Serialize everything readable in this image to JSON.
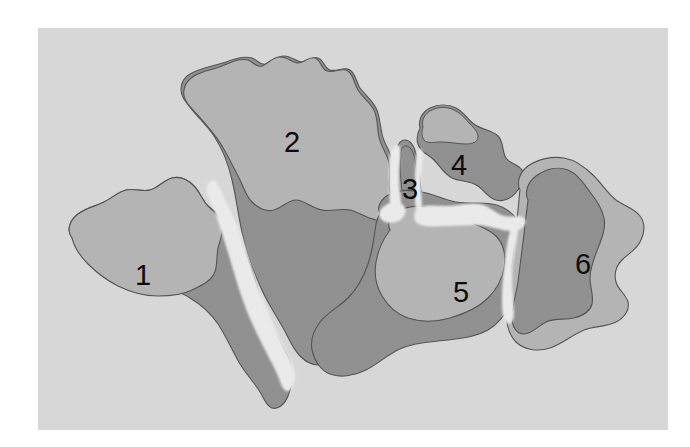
{
  "figure": {
    "kind": "scanned-map-figure",
    "caption_visible": "",
    "plate": {
      "x": 38,
      "y": 28,
      "width": 630,
      "height": 402,
      "background_color": "#d5d5d5",
      "page_margin_color": "#ffffff",
      "paper_texture": true
    },
    "palette": {
      "page": "#ffffff",
      "sea": "#d5d5d5",
      "landmass_fill": "#b0b0b0",
      "shelf_fill": "#8a8a8a",
      "rift_gap": "#e9e9e9",
      "outline": "#4a4a4a",
      "label": "#0b0b0b"
    },
    "labels": [
      {
        "id": "label-1",
        "text": "1",
        "x": 143,
        "y": 277
      },
      {
        "id": "label-2",
        "text": "2",
        "x": 292,
        "y": 144
      },
      {
        "id": "label-3",
        "text": "3",
        "x": 410,
        "y": 191
      },
      {
        "id": "label-4",
        "text": "4",
        "x": 459,
        "y": 167
      },
      {
        "id": "label-5",
        "text": "5",
        "x": 461,
        "y": 294
      },
      {
        "id": "label-6",
        "text": "6",
        "x": 583,
        "y": 266
      }
    ],
    "landmasses": [
      {
        "number": "1",
        "role": "fragment-1"
      },
      {
        "number": "2",
        "role": "fragment-2"
      },
      {
        "number": "3",
        "role": "fragment-3"
      },
      {
        "number": "4",
        "role": "fragment-4"
      },
      {
        "number": "5",
        "role": "fragment-5"
      },
      {
        "number": "6",
        "role": "fragment-6"
      }
    ]
  }
}
